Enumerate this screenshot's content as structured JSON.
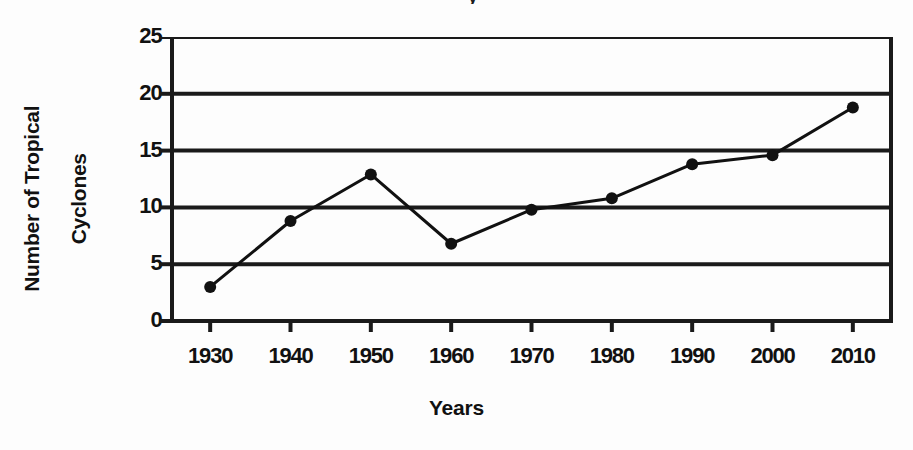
{
  "chart_data": {
    "type": "line",
    "title": "",
    "title_fragment": "y",
    "xlabel": "Years",
    "ylabel": "Number of Tropical Cyclones",
    "ylabel_line1": "Number of Tropical",
    "ylabel_line2": "Cyclones",
    "x": [
      1930,
      1940,
      1950,
      1960,
      1970,
      1980,
      1990,
      2000,
      2010
    ],
    "values": [
      3.0,
      8.8,
      12.9,
      6.8,
      9.8,
      10.8,
      13.8,
      14.6,
      18.8
    ],
    "xtick_labels": [
      "1930",
      "1940",
      "1950",
      "1960",
      "1970",
      "1980",
      "1990",
      "2000",
      "2010"
    ],
    "ytick_labels": [
      "0",
      "5",
      "10",
      "15",
      "20",
      "25"
    ],
    "ytick_values": [
      0,
      5,
      10,
      15,
      20,
      25
    ],
    "xlim": [
      1925,
      2015
    ],
    "ylim": [
      0,
      25
    ],
    "grid": "horizontal",
    "legend": "none",
    "series_color": "#111111",
    "marker": "filled-circle",
    "marker_size": 9,
    "line_width": 3
  },
  "colors": {
    "background": "#fdfdfd",
    "ink": "#111111",
    "grid": "#1a1a1a"
  }
}
